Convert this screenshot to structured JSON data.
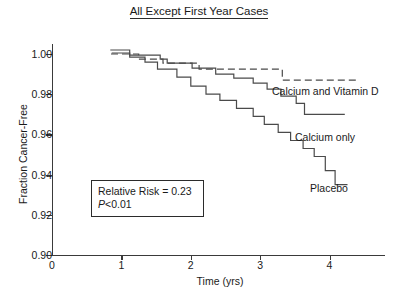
{
  "chart_data": {
    "type": "line",
    "title": "All Except First Year Cases",
    "xlabel": "Time (yrs)",
    "ylabel": "Fraction Cancer-Free",
    "xlim": [
      0,
      4.8
    ],
    "ylim": [
      0.9,
      1.005
    ],
    "xticks": [
      0,
      1,
      2,
      3,
      4
    ],
    "xtick_labels": [
      "0",
      "1",
      "2",
      "3",
      "4"
    ],
    "yticks": [
      0.9,
      0.92,
      0.94,
      0.96,
      0.98,
      1.0
    ],
    "ytick_labels": [
      "0.90",
      "0.92",
      "0.94",
      "0.96",
      "0.98",
      "1.00"
    ],
    "grid": false,
    "legend": "inline-labels",
    "annotations": [
      {
        "name": "relative-risk",
        "text": "Relative Risk = 0.23"
      },
      {
        "name": "p-value",
        "text": "P < 0.01",
        "p_italic": "P",
        "p_rest": "<0.01"
      }
    ],
    "series": [
      {
        "name": "Calcium and Vitamin D",
        "style": "dashed",
        "label_text": "Calcium and Vitamin D",
        "points": [
          [
            0.85,
            1.0
          ],
          [
            1.25,
            1.0
          ],
          [
            1.25,
            0.9975
          ],
          [
            1.6,
            0.9975
          ],
          [
            1.6,
            0.9955
          ],
          [
            2.12,
            0.9955
          ],
          [
            2.12,
            0.9925
          ],
          [
            3.32,
            0.9925
          ],
          [
            3.32,
            0.987
          ],
          [
            4.38,
            0.987
          ]
        ]
      },
      {
        "name": "Calcium only",
        "style": "solid",
        "label_text": "Calcium only",
        "points": [
          [
            0.84,
            1.002
          ],
          [
            1.12,
            1.002
          ],
          [
            1.12,
            0.9995
          ],
          [
            1.56,
            0.9995
          ],
          [
            1.56,
            0.9975
          ],
          [
            1.66,
            0.9975
          ],
          [
            1.66,
            0.9955
          ],
          [
            2.02,
            0.9955
          ],
          [
            2.02,
            0.993
          ],
          [
            2.36,
            0.993
          ],
          [
            2.36,
            0.99
          ],
          [
            2.62,
            0.99
          ],
          [
            2.62,
            0.988
          ],
          [
            2.9,
            0.988
          ],
          [
            2.9,
            0.9855
          ],
          [
            3.1,
            0.9855
          ],
          [
            3.1,
            0.9825
          ],
          [
            3.3,
            0.9825
          ],
          [
            3.3,
            0.979
          ],
          [
            3.52,
            0.979
          ],
          [
            3.52,
            0.9755
          ],
          [
            3.64,
            0.9755
          ],
          [
            3.64,
            0.97
          ],
          [
            4.22,
            0.97
          ]
        ]
      },
      {
        "name": "Placebo",
        "style": "solid",
        "label_text": "Placebo",
        "points": [
          [
            0.86,
            1.0005
          ],
          [
            1.12,
            1.0005
          ],
          [
            1.12,
            0.9985
          ],
          [
            1.34,
            0.9985
          ],
          [
            1.34,
            0.996
          ],
          [
            1.52,
            0.996
          ],
          [
            1.52,
            0.9925
          ],
          [
            1.8,
            0.9925
          ],
          [
            1.8,
            0.9885
          ],
          [
            2.0,
            0.9885
          ],
          [
            2.0,
            0.984
          ],
          [
            2.22,
            0.984
          ],
          [
            2.22,
            0.98
          ],
          [
            2.42,
            0.98
          ],
          [
            2.42,
            0.977
          ],
          [
            2.66,
            0.977
          ],
          [
            2.66,
            0.973
          ],
          [
            2.9,
            0.973
          ],
          [
            2.9,
            0.969
          ],
          [
            3.06,
            0.969
          ],
          [
            3.06,
            0.965
          ],
          [
            3.26,
            0.965
          ],
          [
            3.26,
            0.961
          ],
          [
            3.44,
            0.961
          ],
          [
            3.44,
            0.957
          ],
          [
            3.62,
            0.957
          ],
          [
            3.62,
            0.953
          ],
          [
            3.78,
            0.953
          ],
          [
            3.78,
            0.949
          ],
          [
            3.94,
            0.949
          ],
          [
            3.94,
            0.942
          ],
          [
            4.08,
            0.942
          ],
          [
            4.08,
            0.935
          ],
          [
            4.26,
            0.935
          ]
        ]
      }
    ]
  }
}
